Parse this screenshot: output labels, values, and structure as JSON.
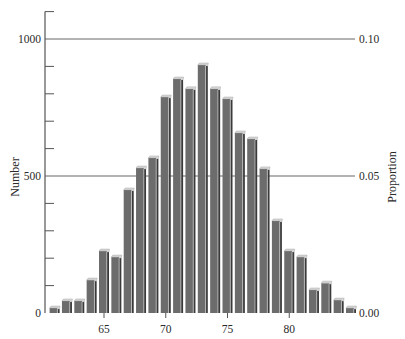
{
  "chart_data": {
    "type": "bar",
    "title": "",
    "xlabel": "",
    "ylabel": "Number",
    "ylabel_right": "Proportion",
    "ylim": [
      0,
      1100
    ],
    "ylim_right": [
      0,
      0.11
    ],
    "y_ticks_labeled": [
      0,
      500,
      1000
    ],
    "y_tick_labels": [
      "0",
      "500",
      "1000"
    ],
    "y_minor_ticks": [
      100,
      200,
      300,
      400,
      600,
      700,
      800,
      900,
      1100
    ],
    "right_ticks_labeled": [
      0.0,
      0.05,
      0.1
    ],
    "right_tick_labels": [
      "0.00",
      "0.05",
      "0.10"
    ],
    "x_ticks": [
      65,
      70,
      75,
      80
    ],
    "x_tick_labels": [
      "65",
      "70",
      "75",
      "80"
    ],
    "gridlines_at": [
      500,
      1000
    ],
    "legend": null,
    "categories": [
      61,
      62,
      63,
      64,
      65,
      66,
      67,
      68,
      69,
      70,
      71,
      72,
      73,
      74,
      75,
      76,
      77,
      78,
      79,
      80,
      81,
      82,
      83,
      84,
      85
    ],
    "values": [
      18,
      44,
      44,
      120,
      226,
      204,
      449,
      529,
      566,
      788,
      854,
      818,
      905,
      818,
      781,
      657,
      635,
      526,
      336,
      226,
      204,
      84,
      109,
      47,
      18
    ]
  },
  "colors": {
    "bar_face": "#6c6c6c",
    "bar_side": "#3a3a3a",
    "bar_top": "#d8d8d8",
    "axis": "#555555",
    "gridline": "#666666"
  }
}
